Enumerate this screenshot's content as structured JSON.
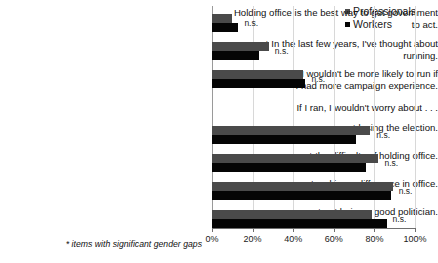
{
  "chart_data": {
    "type": "bar",
    "orientation": "horizontal",
    "title": "",
    "xlabel": "",
    "ylabel": "",
    "xlim": [
      0,
      100
    ],
    "xticks": [
      "0%",
      "20%",
      "40%",
      "60%",
      "80%",
      "100%"
    ],
    "xtick_values": [
      0,
      20,
      40,
      60,
      80,
      100
    ],
    "grid": true,
    "legend_position": "top-right",
    "categories": [
      "Holding office is the best way to get government to act.",
      "* In the last few years, I've thought about running.",
      "I wouldn't be more likely to run if\nI had more campaign experience.",
      "If I ran, I wouldn't worry about . . .",
      "* losing the election.",
      "* the difficulty of holding office.",
      "not making a difference in office.",
      "* not being a good politician."
    ],
    "series": [
      {
        "name": "Professionals",
        "color": "#4a4a4a",
        "values": [
          10,
          28,
          45,
          null,
          78,
          82,
          89,
          79
        ]
      },
      {
        "name": "Workers",
        "color": "#050505",
        "values": [
          13,
          23,
          46,
          null,
          71,
          76,
          88,
          86
        ]
      }
    ],
    "annotations": [
      "n.s.",
      "n.s.",
      "n.s.",
      "",
      "n.s.",
      "n.s.",
      "n.s.",
      "n.s."
    ],
    "footnote": "* items with significant gender gaps"
  },
  "legend": {
    "items": [
      {
        "label": "Professionals",
        "color": "#4a4a4a"
      },
      {
        "label": "Workers",
        "color": "#050505"
      }
    ]
  },
  "footnote": "* items with significant gender gaps",
  "axis": {
    "ticks": [
      "0%",
      "20%",
      "40%",
      "60%",
      "80%",
      "100%"
    ]
  }
}
